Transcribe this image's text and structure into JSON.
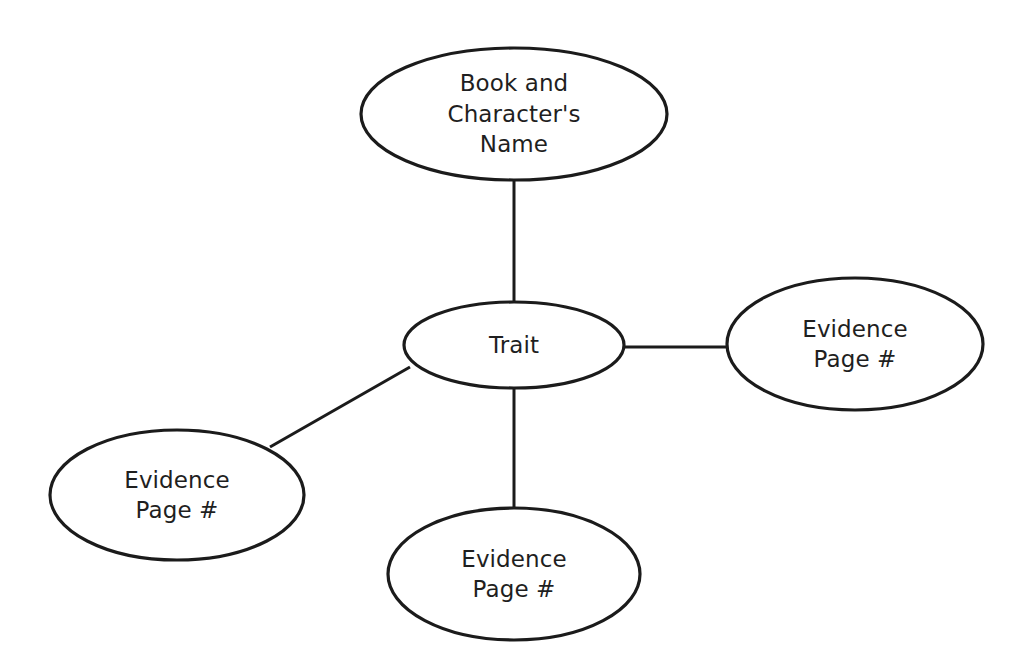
{
  "diagram": {
    "type": "concept-web",
    "background_color": "#ffffff",
    "stroke_color": "#1b1b1b",
    "text_color": "#1f1f1f",
    "nodes": [
      {
        "id": "book-character-name",
        "role": "root",
        "lines": [
          "Book and",
          "Character's",
          "Name"
        ],
        "cx": 514,
        "cy": 114,
        "rx": 153,
        "ry": 66
      },
      {
        "id": "trait",
        "role": "center",
        "lines": [
          "Trait"
        ],
        "cx": 514,
        "cy": 345,
        "rx": 110,
        "ry": 43
      },
      {
        "id": "evidence-right",
        "role": "leaf",
        "lines": [
          "Evidence",
          "Page #"
        ],
        "cx": 855,
        "cy": 344,
        "rx": 128,
        "ry": 66
      },
      {
        "id": "evidence-left",
        "role": "leaf",
        "lines": [
          "Evidence",
          "Page #"
        ],
        "cx": 177,
        "cy": 495,
        "rx": 127,
        "ry": 65
      },
      {
        "id": "evidence-bottom",
        "role": "leaf",
        "lines": [
          "Evidence",
          "Page #"
        ],
        "cx": 514,
        "cy": 574,
        "rx": 126,
        "ry": 66
      }
    ],
    "edges": [
      {
        "id": "edge-root-trait",
        "from": "book-character-name",
        "to": "trait",
        "x1": 514,
        "y1": 180,
        "x2": 514,
        "y2": 303
      },
      {
        "id": "edge-trait-right",
        "from": "trait",
        "to": "evidence-right",
        "x1": 625,
        "y1": 347,
        "x2": 727,
        "y2": 347
      },
      {
        "id": "edge-trait-left",
        "from": "trait",
        "to": "evidence-left",
        "x1": 410,
        "y1": 367,
        "x2": 270,
        "y2": 447
      },
      {
        "id": "edge-trait-bottom",
        "from": "trait",
        "to": "evidence-bottom",
        "x1": 514,
        "y1": 388,
        "x2": 514,
        "y2": 508
      }
    ]
  }
}
